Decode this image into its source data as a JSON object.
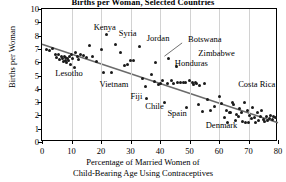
{
  "chart_data": {
    "type": "scatter",
    "title": "Births per Woman, Selected Countries",
    "xlabel_line1": "Percentage of Married Women of",
    "xlabel_line2": "Child-Bearing Age Using Contraceptives",
    "ylabel": "Births per Woman",
    "xlim": [
      0,
      80
    ],
    "ylim": [
      0,
      10
    ],
    "xticks": [
      0,
      10,
      20,
      30,
      40,
      50,
      60,
      70,
      80
    ],
    "yticks": [
      0,
      1,
      2,
      3,
      4,
      5,
      6,
      7,
      8,
      9,
      10
    ],
    "grid": "vertical",
    "legend": "none",
    "marker_color": "#1a1a1a",
    "trendline_color": "#6b6b6b",
    "trendline": {
      "x0": 0,
      "y0": 7.35,
      "x1": 80,
      "y1": 1.45
    },
    "points": [
      [
        1.5,
        6.95
      ],
      [
        2.5,
        6.85
      ],
      [
        3.5,
        7.05
      ],
      [
        4.5,
        6.6
      ],
      [
        5.0,
        6.35
      ],
      [
        5.5,
        6.6
      ],
      [
        6.0,
        6.2
      ],
      [
        6.5,
        6.45
      ],
      [
        7.0,
        6.3
      ],
      [
        7.2,
        6.05
      ],
      [
        7.5,
        6.4
      ],
      [
        7.8,
        6.15
      ],
      [
        8.0,
        6.35
      ],
      [
        8.3,
        5.95
      ],
      [
        8.6,
        6.25
      ],
      [
        9.0,
        6.1
      ],
      [
        9.3,
        6.4
      ],
      [
        9.6,
        5.85
      ],
      [
        10.0,
        6.55
      ],
      [
        10.5,
        6.3
      ],
      [
        11.0,
        5.6
      ],
      [
        11.5,
        6.7
      ],
      [
        12.0,
        6.45
      ],
      [
        12.5,
        6.2
      ],
      [
        13.0,
        6.6
      ],
      [
        14.0,
        6.5
      ],
      [
        15.0,
        6.35
      ],
      [
        16.0,
        7.25
      ],
      [
        17.0,
        6.45
      ],
      [
        18.5,
        6.05
      ],
      [
        20.0,
        6.95
      ],
      [
        21.0,
        5.2
      ],
      [
        22.0,
        8.05
      ],
      [
        23.5,
        5.25
      ],
      [
        25.0,
        7.3
      ],
      [
        26.5,
        6.75
      ],
      [
        28.0,
        5.75
      ],
      [
        29.0,
        5.8
      ],
      [
        30.0,
        6.1
      ],
      [
        31.0,
        6.1
      ],
      [
        33.0,
        7.15
      ],
      [
        34.0,
        4.8
      ],
      [
        35.0,
        4.2
      ],
      [
        35.5,
        3.25
      ],
      [
        37.0,
        5.05
      ],
      [
        38.0,
        4.55
      ],
      [
        38.5,
        6.0
      ],
      [
        39.5,
        4.35
      ],
      [
        40.0,
        4.4
      ],
      [
        41.0,
        4.6
      ],
      [
        41.5,
        2.95
      ],
      [
        42.5,
        4.4
      ],
      [
        43.0,
        6.3
      ],
      [
        44.0,
        4.6
      ],
      [
        44.5,
        4.4
      ],
      [
        45.5,
        5.65
      ],
      [
        46.0,
        4.5
      ],
      [
        47.0,
        4.45
      ],
      [
        48.0,
        4.5
      ],
      [
        48.5,
        4.45
      ],
      [
        49.0,
        2.6
      ],
      [
        50.0,
        4.65
      ],
      [
        51.0,
        4.45
      ],
      [
        51.5,
        4.35
      ],
      [
        52.0,
        4.5
      ],
      [
        52.5,
        4.4
      ],
      [
        53.0,
        2.85
      ],
      [
        53.5,
        4.25
      ],
      [
        54.5,
        2.3
      ],
      [
        55.0,
        4.4
      ],
      [
        56.0,
        3.2
      ],
      [
        57.0,
        2.35
      ],
      [
        58.5,
        2.65
      ],
      [
        60.0,
        3.45
      ],
      [
        61.0,
        2.9
      ],
      [
        62.0,
        1.85
      ],
      [
        62.5,
        2.4
      ],
      [
        63.0,
        1.5
      ],
      [
        63.5,
        2.25
      ],
      [
        64.0,
        2.2
      ],
      [
        64.5,
        3.0
      ],
      [
        65.0,
        2.85
      ],
      [
        65.5,
        1.6
      ],
      [
        66.0,
        2.1
      ],
      [
        66.5,
        1.95
      ],
      [
        67.0,
        2.55
      ],
      [
        67.5,
        2.2
      ],
      [
        68.0,
        1.55
      ],
      [
        68.5,
        2.95
      ],
      [
        69.0,
        1.5
      ],
      [
        69.5,
        2.35
      ],
      [
        70.0,
        1.5
      ],
      [
        70.5,
        2.0
      ],
      [
        71.0,
        1.75
      ],
      [
        71.5,
        2.6
      ],
      [
        72.0,
        1.85
      ],
      [
        72.5,
        1.5
      ],
      [
        73.0,
        2.2
      ],
      [
        73.5,
        1.6
      ],
      [
        74.0,
        1.9
      ],
      [
        74.5,
        2.35
      ],
      [
        75.0,
        1.7
      ],
      [
        75.5,
        1.55
      ],
      [
        76.0,
        1.95
      ],
      [
        76.5,
        1.6
      ],
      [
        77.0,
        1.8
      ],
      [
        77.5,
        2.0
      ],
      [
        78.0,
        1.7
      ],
      [
        78.5,
        1.9
      ],
      [
        79.0,
        1.85
      ]
    ],
    "annotations": [
      {
        "text": "Kenya",
        "x": 17.5,
        "y": 8.55
      },
      {
        "text": "Syria",
        "x": 26.0,
        "y": 8.15
      },
      {
        "text": "Jordan",
        "x": 35.5,
        "y": 7.75
      },
      {
        "text": "Botswana",
        "x": 49.5,
        "y": 7.7
      },
      {
        "text": "Zimbabwe",
        "x": 53.0,
        "y": 6.6
      },
      {
        "text": "Honduras",
        "x": 45.0,
        "y": 5.85
      },
      {
        "text": "Lesotho",
        "x": 4.5,
        "y": 5.1
      },
      {
        "text": "Vietnam",
        "x": 19.5,
        "y": 4.25
      },
      {
        "text": "Costa Rica",
        "x": 66.5,
        "y": 4.3
      },
      {
        "text": "Fiji",
        "x": 30.0,
        "y": 3.35
      },
      {
        "text": "Chile",
        "x": 35.0,
        "y": 2.65
      },
      {
        "text": "Spain",
        "x": 42.5,
        "y": 2.1
      },
      {
        "text": "Denmark",
        "x": 55.5,
        "y": 1.2
      }
    ],
    "leaders": [
      {
        "x0": 47.5,
        "y0": 7.45,
        "x1": 41.5,
        "y1": 6.45
      }
    ]
  }
}
